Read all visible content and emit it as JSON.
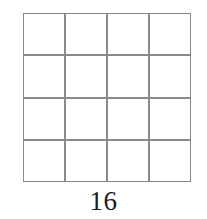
{
  "figure": {
    "type": "square-grid",
    "caption": "16",
    "grid": {
      "rows": 4,
      "columns": 4,
      "total_cells": 16,
      "line_color": "#8a8a8a",
      "cell_fill": "#ffffff",
      "line_thickness_px": 2
    },
    "background_color": "#ffffff",
    "caption_color": "#1c1c1c"
  }
}
